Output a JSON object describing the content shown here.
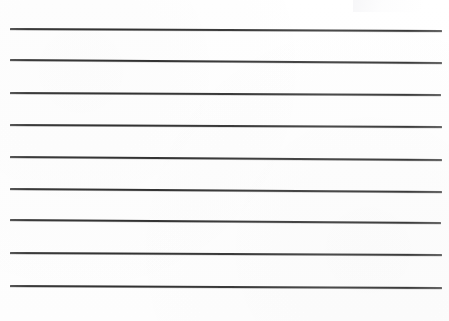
{
  "document": {
    "kind": "ruled-paper-scan",
    "title": "Blank lined paper",
    "page_width": 449,
    "page_height": 321,
    "background_color": "#ffffff",
    "rule_color": "#3a3a3a",
    "has_text": false,
    "text_content": "",
    "rule_count": 9
  },
  "rules": [
    {
      "index": 1,
      "x_start": 10,
      "x_end": 442,
      "y_start": 29,
      "y_end": 31,
      "thickness": 1.6
    },
    {
      "index": 2,
      "x_start": 10,
      "x_end": 442,
      "y_start": 60,
      "y_end": 63,
      "thickness": 1.6
    },
    {
      "index": 3,
      "x_start": 10,
      "x_end": 441,
      "y_start": 93,
      "y_end": 95,
      "thickness": 1.5
    },
    {
      "index": 4,
      "x_start": 10,
      "x_end": 442,
      "y_start": 125,
      "y_end": 127,
      "thickness": 1.6
    },
    {
      "index": 5,
      "x_start": 10,
      "x_end": 442,
      "y_start": 157,
      "y_end": 160,
      "thickness": 1.5
    },
    {
      "index": 6,
      "x_start": 10,
      "x_end": 442,
      "y_start": 189,
      "y_end": 192,
      "thickness": 1.6
    },
    {
      "index": 7,
      "x_start": 10,
      "x_end": 441,
      "y_start": 220,
      "y_end": 223,
      "thickness": 1.5
    },
    {
      "index": 8,
      "x_start": 10,
      "x_end": 442,
      "y_start": 253,
      "y_end": 255,
      "thickness": 1.6
    },
    {
      "index": 9,
      "x_start": 10,
      "x_end": 442,
      "y_start": 286,
      "y_end": 288,
      "thickness": 1.6
    }
  ],
  "artifacts": [
    {
      "name": "top-right-smudge",
      "x": 353,
      "y": 0,
      "width": 70,
      "height": 14,
      "color": "#f6f6f8"
    }
  ]
}
